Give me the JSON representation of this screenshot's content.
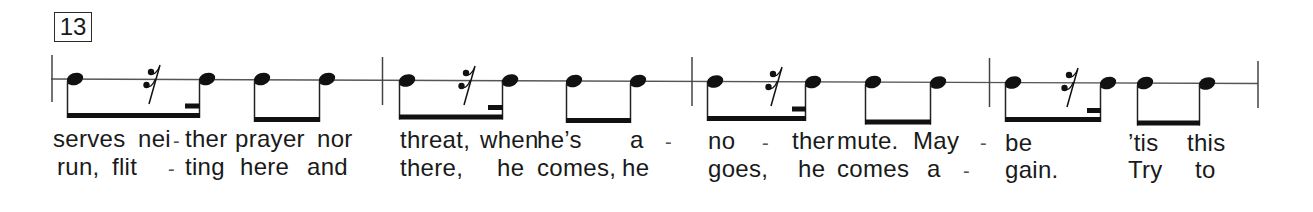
{
  "score": {
    "measure_number": "13",
    "colors": {
      "ink": "#1a1a1a",
      "staff_line": "#555555",
      "background": "#ffffff"
    },
    "measures": [
      {
        "rhythm": [
          {
            "type": "note",
            "duration": "eighth",
            "beam_group": 1
          },
          {
            "type": "rest",
            "duration": "sixteenth",
            "beam_group": 1
          },
          {
            "type": "note",
            "duration": "sixteenth",
            "beam_group": 1
          },
          {
            "type": "note",
            "duration": "eighth",
            "beam_group": 2
          },
          {
            "type": "note",
            "duration": "eighth",
            "beam_group": 2
          }
        ],
        "verse1": [
          "serves",
          "nei",
          "-",
          "ther",
          "prayer",
          "nor"
        ],
        "verse2": [
          "run,",
          "flit",
          "-",
          "ting",
          "here",
          "and"
        ]
      },
      {
        "rhythm": [
          {
            "type": "note",
            "duration": "eighth",
            "beam_group": 1
          },
          {
            "type": "rest",
            "duration": "sixteenth",
            "beam_group": 1
          },
          {
            "type": "note",
            "duration": "sixteenth",
            "beam_group": 1
          },
          {
            "type": "note",
            "duration": "eighth",
            "beam_group": 2
          },
          {
            "type": "note",
            "duration": "eighth",
            "beam_group": 2
          }
        ],
        "verse1": [
          "threat,",
          "when",
          "he’s",
          "a",
          "-"
        ],
        "verse2": [
          "there,",
          "he",
          "comes,",
          "he"
        ]
      },
      {
        "rhythm": [
          {
            "type": "note",
            "duration": "eighth",
            "beam_group": 1
          },
          {
            "type": "rest",
            "duration": "sixteenth",
            "beam_group": 1
          },
          {
            "type": "note",
            "duration": "sixteenth",
            "beam_group": 1
          },
          {
            "type": "note",
            "duration": "eighth",
            "beam_group": 2
          },
          {
            "type": "note",
            "duration": "eighth",
            "beam_group": 2
          }
        ],
        "verse1": [
          "no",
          "-",
          "ther",
          "mute.",
          "May",
          "-"
        ],
        "verse2": [
          "goes,",
          "he",
          "comes",
          "a",
          "-"
        ]
      },
      {
        "rhythm": [
          {
            "type": "note",
            "duration": "eighth",
            "beam_group": 1
          },
          {
            "type": "rest",
            "duration": "sixteenth",
            "beam_group": 1
          },
          {
            "type": "note",
            "duration": "sixteenth",
            "beam_group": 1
          },
          {
            "type": "note",
            "duration": "eighth",
            "beam_group": 2
          },
          {
            "type": "note",
            "duration": "eighth",
            "beam_group": 2
          }
        ],
        "verse1": [
          "be",
          "’tis",
          "this"
        ],
        "verse2": [
          "gain.",
          "Try",
          "to"
        ]
      }
    ]
  }
}
